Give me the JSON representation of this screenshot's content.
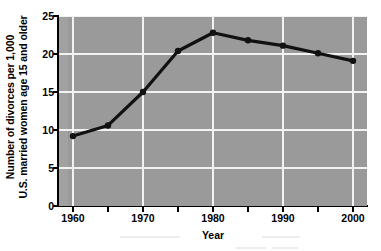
{
  "chart_data": {
    "type": "line",
    "title": "",
    "xlabel": "Year",
    "ylabel": "Number of divorces per 1,000 U.S. married women age 15 and older",
    "ylabel_line1": "Number of divorces per 1,000",
    "ylabel_line2": "U.S. married women age 15 and older",
    "x": [
      1960,
      1965,
      1970,
      1975,
      1980,
      1985,
      1990,
      1995,
      2000
    ],
    "values": [
      9.2,
      10.6,
      15.0,
      20.4,
      22.8,
      21.8,
      21.1,
      20.1,
      19.1
    ],
    "series": [
      {
        "name": "Divorce rate",
        "values": [
          9.2,
          10.6,
          15.0,
          20.4,
          22.8,
          21.8,
          21.1,
          20.1,
          19.1
        ]
      }
    ],
    "xlim": [
      1958,
      2002
    ],
    "ylim": [
      0,
      25
    ],
    "xticks": [
      1960,
      1965,
      1970,
      1975,
      1980,
      1985,
      1990,
      1995,
      2000
    ],
    "xtick_labels": [
      "1960",
      "",
      "1970",
      "",
      "1980",
      "",
      "1990",
      "",
      "2000"
    ],
    "yticks": [
      0,
      5,
      10,
      15,
      20,
      25
    ],
    "ytick_labels": [
      "0",
      "5",
      "10",
      "15",
      "20",
      "25"
    ],
    "grid": true,
    "grid_color": "#f2f2f2",
    "legend": "none",
    "plot_background": "#9a9a9a",
    "line_color": "#111111",
    "marker": "circle",
    "marker_color": "#111111",
    "figure_background": "#ffffff"
  }
}
